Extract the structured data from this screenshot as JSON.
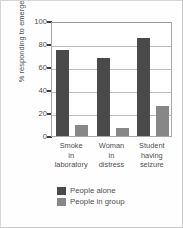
{
  "chart_data": {
    "type": "bar",
    "title": "",
    "xlabel": "",
    "ylabel": "% responding to emergency",
    "ylim": [
      0,
      100
    ],
    "yticks": [
      0,
      20,
      40,
      60,
      80,
      100
    ],
    "ytick_labels": [
      "0",
      "20",
      "40",
      "60",
      "80",
      "100"
    ],
    "grid": true,
    "grid_axis": "y",
    "legend_position": "bottom",
    "categories": [
      "Smoke in laboratory",
      "Woman in distress",
      "Student having seizure"
    ],
    "category_lines": [
      [
        "Smoke",
        "in",
        "laboratory"
      ],
      [
        "Woman",
        "in",
        "distress"
      ],
      [
        "Student",
        "having",
        "seizure"
      ]
    ],
    "series": [
      {
        "name": "People alone",
        "color": "#4a4a4a",
        "values": [
          75,
          68,
          85
        ]
      },
      {
        "name": "People in group",
        "color": "#878787",
        "values": [
          10,
          7,
          26
        ]
      }
    ]
  },
  "colors": {
    "series_alone": "#4a4a4a",
    "series_group": "#878787",
    "axis": "#a8a8a8",
    "grid": "#bdbdbd",
    "text": "#4e4e4e",
    "frame": "#d6d6d6"
  }
}
